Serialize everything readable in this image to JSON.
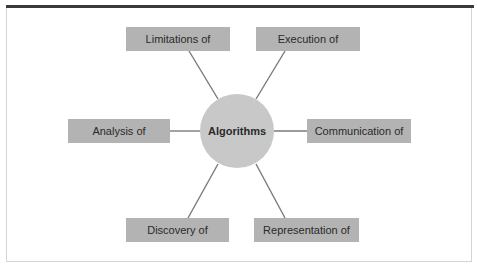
{
  "diagram": {
    "center": {
      "label": "Algorithms"
    },
    "nodes": [
      {
        "id": "limitations",
        "label": "Limitations of"
      },
      {
        "id": "execution",
        "label": "Execution of"
      },
      {
        "id": "analysis",
        "label": "Analysis of"
      },
      {
        "id": "communication",
        "label": "Communication of"
      },
      {
        "id": "discovery",
        "label": "Discovery of"
      },
      {
        "id": "representation",
        "label": "Representation of"
      }
    ],
    "colors": {
      "box_fill": "#b3b3b3",
      "hub_fill": "#c8c8c8",
      "connector": "#7a7a7a",
      "top_rule": "#3a3a3a"
    }
  }
}
